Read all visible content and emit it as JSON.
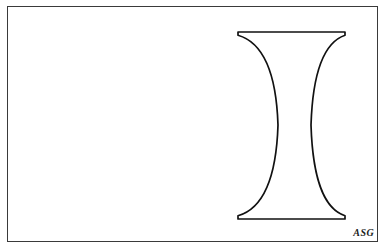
{
  "figure": {
    "kind": "line-drawing",
    "background_color": "#ffffff",
    "stroke_color": "#111111",
    "frame": {
      "present": true,
      "color": "#3a3a3a",
      "x": 7,
      "y": 6,
      "width": 371,
      "height": 236
    },
    "glyph": {
      "character": "I",
      "top_bar_y": 32,
      "bottom_bar_y": 219,
      "left_edge_x": 238,
      "right_edge_x": 345,
      "waist_left_x": 278,
      "waist_right_x": 311,
      "waist_y": 125
    }
  },
  "signature": {
    "text": "ASG"
  }
}
